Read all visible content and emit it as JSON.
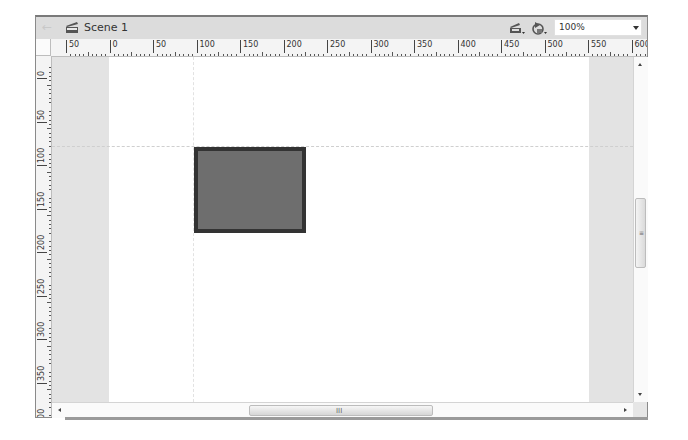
{
  "header": {
    "scene_label": "Scene 1",
    "back_icon": "back-arrow-icon",
    "scene_icon": "clapperboard-icon",
    "edit_scene_icon": "edit-scene-icon",
    "edit_symbol_icon": "edit-symbols-icon",
    "zoom": {
      "value": "100%",
      "icon": "chevron-down-icon"
    }
  },
  "rulers": {
    "horizontal": [
      "50",
      "0",
      "50",
      "100",
      "150",
      "200",
      "250",
      "300",
      "350",
      "400",
      "450",
      "500",
      "550",
      "600"
    ],
    "vertical": [
      "0",
      "50",
      "100",
      "150",
      "200",
      "250",
      "300",
      "350",
      "400"
    ]
  },
  "stage": {
    "background": "#ffffff",
    "pasteboard": "#e3e3e3",
    "shape": {
      "type": "rectangle",
      "fill": "#6e6e6e",
      "stroke": "#333333"
    },
    "guides": {
      "horizontal_y": "100",
      "vertical_x": "100"
    }
  },
  "scrollbars": {
    "vertical_grip": "≡",
    "horizontal_grip": "III"
  }
}
